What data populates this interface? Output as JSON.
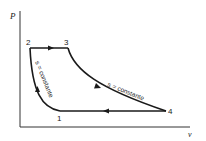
{
  "diagram": {
    "type": "pv-diagram",
    "axes": {
      "y_label": "P",
      "x_label": "v"
    },
    "points": [
      {
        "id": "1",
        "label": "1"
      },
      {
        "id": "2",
        "label": "2"
      },
      {
        "id": "3",
        "label": "3"
      },
      {
        "id": "4",
        "label": "4"
      }
    ],
    "annotations": {
      "isentropic_compression": "s = constante",
      "isentropic_expansion": "s = constante"
    },
    "colors": {
      "line": "#1a1a1a",
      "background": "#ffffff"
    }
  }
}
